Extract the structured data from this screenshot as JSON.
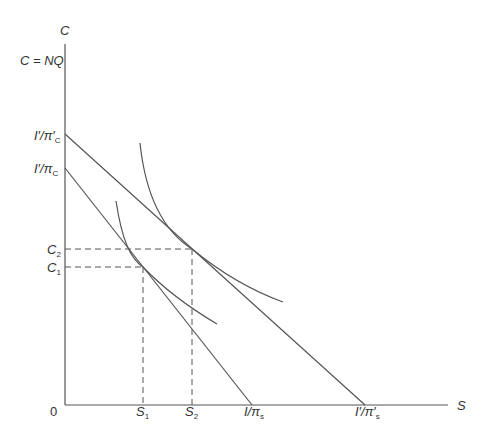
{
  "diagram": {
    "y_axis_label": "C",
    "x_axis_label": "S",
    "origin_label": "0",
    "constraint_label": "C = NQ",
    "y_ticks": {
      "upper_intercept": "I′/π′",
      "upper_intercept_sub": "C",
      "lower_intercept": "I′/π",
      "lower_intercept_sub": "C",
      "c2": "C",
      "c2_sub": "2",
      "c1": "C",
      "c1_sub": "1"
    },
    "x_ticks": {
      "s1": "S",
      "s1_sub": "1",
      "s2": "S",
      "s2_sub": "2",
      "lower_intercept": "I/π",
      "lower_intercept_sub": "s",
      "upper_intercept": "I′/π′",
      "upper_intercept_sub": "s"
    },
    "line_color": "#555555",
    "elements": [
      {
        "type": "budget_line",
        "name": "original",
        "from": "I′/πC",
        "to": "I/πs"
      },
      {
        "type": "budget_line",
        "name": "new",
        "from": "I′/π′C",
        "to": "I′/π′s"
      },
      {
        "type": "indifference_curve",
        "name": "lower",
        "tangent_at": [
          "S1",
          "C1"
        ]
      },
      {
        "type": "indifference_curve",
        "name": "upper",
        "tangent_at": [
          "S2",
          "C2"
        ]
      }
    ]
  }
}
